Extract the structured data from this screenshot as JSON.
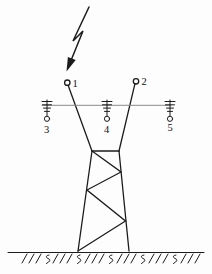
{
  "diagram": {
    "description_labels": {
      "p1": "1",
      "p2": "2",
      "p3": "3",
      "p4": "4",
      "p5": "5"
    },
    "colors": {
      "ink": "#1c1c1c",
      "crossarm": "#8a8a8a",
      "background": "#fdfdfd"
    }
  }
}
